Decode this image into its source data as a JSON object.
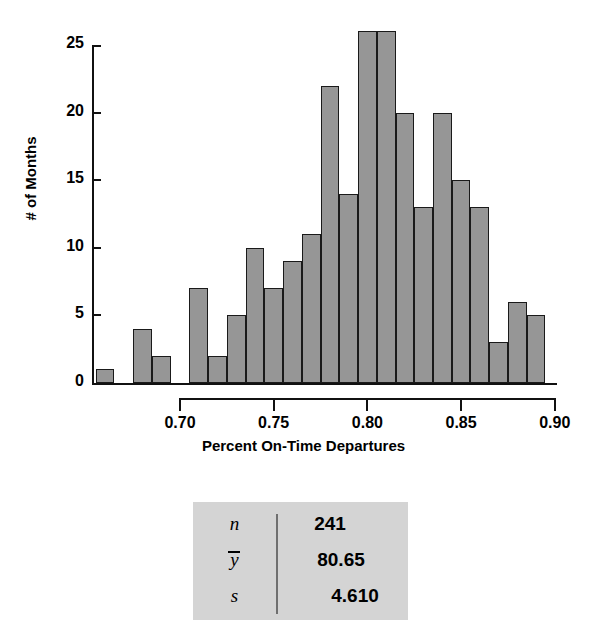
{
  "chart_data": {
    "type": "bar",
    "title": "",
    "xlabel": "Percent On-Time Departures",
    "ylabel": "# of Months",
    "xlim": [
      0.655,
      0.9
    ],
    "ylim": [
      0,
      26
    ],
    "bin_width": 0.01,
    "grid": false,
    "legend": null,
    "xticks": [
      "0.70",
      "0.75",
      "0.80",
      "0.85",
      "0.90"
    ],
    "xtick_values": [
      0.7,
      0.75,
      0.8,
      0.85,
      0.9
    ],
    "yticks": [
      "0",
      "5",
      "10",
      "15",
      "20",
      "25"
    ],
    "ytick_values": [
      0,
      5,
      10,
      15,
      20,
      25
    ],
    "bins": [
      {
        "left": 0.655,
        "right": 0.665,
        "value": 1
      },
      {
        "left": 0.665,
        "right": 0.675,
        "value": 0
      },
      {
        "left": 0.675,
        "right": 0.685,
        "value": 4
      },
      {
        "left": 0.685,
        "right": 0.695,
        "value": 2
      },
      {
        "left": 0.695,
        "right": 0.705,
        "value": 0
      },
      {
        "left": 0.705,
        "right": 0.715,
        "value": 7
      },
      {
        "left": 0.715,
        "right": 0.725,
        "value": 2
      },
      {
        "left": 0.725,
        "right": 0.735,
        "value": 5
      },
      {
        "left": 0.735,
        "right": 0.745,
        "value": 10
      },
      {
        "left": 0.745,
        "right": 0.755,
        "value": 7
      },
      {
        "left": 0.755,
        "right": 0.765,
        "value": 9
      },
      {
        "left": 0.765,
        "right": 0.775,
        "value": 11
      },
      {
        "left": 0.775,
        "right": 0.785,
        "value": 22
      },
      {
        "left": 0.785,
        "right": 0.795,
        "value": 14
      },
      {
        "left": 0.795,
        "right": 0.805,
        "value": 26
      },
      {
        "left": 0.805,
        "right": 0.815,
        "value": 26
      },
      {
        "left": 0.815,
        "right": 0.825,
        "value": 20
      },
      {
        "left": 0.825,
        "right": 0.835,
        "value": 13
      },
      {
        "left": 0.835,
        "right": 0.845,
        "value": 20
      },
      {
        "left": 0.845,
        "right": 0.855,
        "value": 15
      },
      {
        "left": 0.855,
        "right": 0.865,
        "value": 13
      },
      {
        "left": 0.865,
        "right": 0.875,
        "value": 3
      },
      {
        "left": 0.875,
        "right": 0.885,
        "value": 6
      },
      {
        "left": 0.885,
        "right": 0.895,
        "value": 5
      }
    ],
    "bar_fill_color": "#969696",
    "bar_edge_color": "#1a1a1a"
  },
  "stats_table": {
    "rows": [
      {
        "symbol": "n",
        "overbar": false,
        "value": "241"
      },
      {
        "symbol": "y",
        "overbar": true,
        "value": "80.65"
      },
      {
        "symbol": "s",
        "overbar": false,
        "value": "4.610"
      }
    ],
    "background_color": "#d4d4d4"
  }
}
